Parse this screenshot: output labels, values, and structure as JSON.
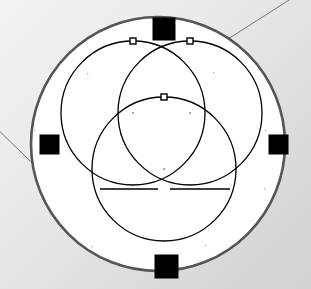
{
  "canvas": {
    "width": 311,
    "height": 289,
    "background_color": "#e8e8e8",
    "paper_fill": "#ffffff",
    "stroke_color": "#000000",
    "outer_circle_stroke": "#555555",
    "guide_line_stroke": "#777777",
    "handle_fill": "#000000",
    "handle_stroke": "#000000",
    "point_marker_color": "#555555"
  },
  "figure": {
    "name": "three-overlapping-circles-construction",
    "outer_circle": {
      "name": "enclosing-circle",
      "cx": 158,
      "cy": 144,
      "r": 127,
      "stroke_width": 2.6,
      "fill": "#ffffff"
    },
    "circles": [
      {
        "name": "circle-upper-left",
        "cx": 133,
        "cy": 113,
        "r": 72,
        "stroke_width": 1.3
      },
      {
        "name": "circle-upper-right",
        "cx": 190,
        "cy": 113,
        "r": 72,
        "stroke_width": 1.3
      },
      {
        "name": "circle-lower",
        "cx": 164,
        "cy": 169,
        "r": 72,
        "stroke_width": 1.3
      }
    ],
    "square_handles": [
      {
        "name": "handle-square-top",
        "x": 153,
        "y": 18,
        "size": 22
      },
      {
        "name": "handle-square-left",
        "x": 40,
        "y": 135,
        "size": 19
      },
      {
        "name": "handle-square-right",
        "x": 269,
        "y": 135,
        "size": 19
      },
      {
        "name": "handle-square-bottom",
        "x": 155,
        "y": 255,
        "size": 23
      }
    ],
    "node_handles": [
      {
        "name": "node-handle-upper-left",
        "cx": 133,
        "cy": 41,
        "size": 6
      },
      {
        "name": "node-handle-upper-right",
        "cx": 190,
        "cy": 41,
        "size": 6
      },
      {
        "name": "node-handle-lower",
        "cx": 164,
        "cy": 97,
        "size": 6
      }
    ],
    "center_markers": [
      {
        "name": "center-marker-upper-left",
        "cx": 133,
        "cy": 113
      },
      {
        "name": "center-marker-upper-right",
        "cx": 190,
        "cy": 113
      },
      {
        "name": "center-marker-lower",
        "cx": 164,
        "cy": 169
      }
    ],
    "speckle_dots": [
      {
        "cx": 92,
        "cy": 15
      },
      {
        "cx": 148,
        "cy": 16
      },
      {
        "cx": 205,
        "cy": 17
      },
      {
        "cx": 35,
        "cy": 72
      },
      {
        "cx": 265,
        "cy": 70
      },
      {
        "cx": 34,
        "cy": 130
      },
      {
        "cx": 265,
        "cy": 130
      },
      {
        "cx": 36,
        "cy": 190
      },
      {
        "cx": 264,
        "cy": 188
      },
      {
        "cx": 91,
        "cy": 246
      },
      {
        "cx": 205,
        "cy": 245
      },
      {
        "cx": 87,
        "cy": 73
      },
      {
        "cx": 213,
        "cy": 72
      },
      {
        "cx": 120,
        "cy": 134
      }
    ],
    "guide_lines": [
      {
        "name": "guide-line-top-right",
        "x1": 311,
        "y1": -14,
        "x2": 214,
        "y2": 48
      },
      {
        "name": "guide-line-left",
        "x1": -12,
        "y1": 120,
        "x2": 62,
        "y2": 192
      }
    ],
    "chord_segments": [
      {
        "name": "chord-lower-left",
        "x1": 100,
        "y1": 189,
        "x2": 158,
        "y2": 189
      },
      {
        "name": "chord-lower-right",
        "x1": 170,
        "y1": 189,
        "x2": 230,
        "y2": 189
      }
    ]
  }
}
